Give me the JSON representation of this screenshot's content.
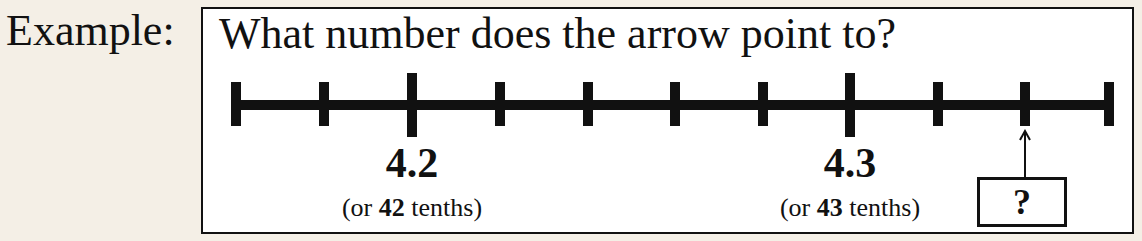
{
  "label": "Example:",
  "question": "What number does the arrow point to?",
  "number_line": {
    "ticks": [
      {
        "x": 28,
        "type": "end"
      },
      {
        "x": 116,
        "type": "minor"
      },
      {
        "x": 204,
        "type": "major"
      },
      {
        "x": 292,
        "type": "minor"
      },
      {
        "x": 380,
        "type": "minor"
      },
      {
        "x": 467,
        "type": "minor"
      },
      {
        "x": 555,
        "type": "minor"
      },
      {
        "x": 642,
        "type": "major"
      },
      {
        "x": 730,
        "type": "minor"
      },
      {
        "x": 817,
        "type": "minor"
      },
      {
        "x": 901,
        "type": "end"
      }
    ],
    "labels": [
      {
        "value": "4.2",
        "pre": "(or ",
        "bold": "42",
        "post": " tenths)",
        "x": 209
      },
      {
        "value": "4.3",
        "pre": "(or ",
        "bold": "43",
        "post": " tenths)",
        "x": 647
      }
    ]
  },
  "answer_box": "?"
}
